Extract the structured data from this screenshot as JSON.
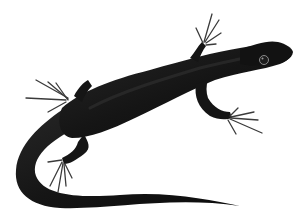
{
  "image": {
    "subject": "lizard",
    "description": "Black-bodied lizard illustration on white background, viewed from above, head pointing right, long curling tail",
    "colors": {
      "background": "#ffffff",
      "body": "#141414",
      "body_highlight": "#2e2e2e",
      "toes": "#3a3a3a",
      "eye": "#1c1c1c",
      "eye_ring": "#8a8a8a"
    }
  }
}
